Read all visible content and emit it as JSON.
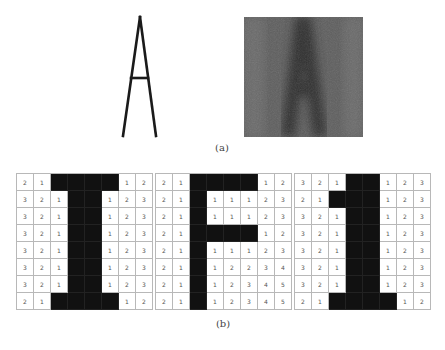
{
  "figure": {
    "panel_a": {
      "caption": "(a)",
      "glyph_letter": "A",
      "glyph_description": "thin-stroke letter A outline",
      "noisy_image_description": "noisy grayscale image of letter A",
      "gray_background": "#5c5c5c",
      "gray_letter": "#3a3a3a"
    },
    "panel_b": {
      "caption": "(b)",
      "grids": [
        {
          "letter": "I",
          "rows": [
            [
              "2",
              "1",
              "",
              "",
              "",
              "",
              "1",
              "2"
            ],
            [
              "3",
              "2",
              "1",
              "",
              "",
              "1",
              "2",
              "3"
            ],
            [
              "3",
              "2",
              "1",
              "",
              "",
              "1",
              "2",
              "3"
            ],
            [
              "3",
              "2",
              "1",
              "",
              "",
              "1",
              "2",
              "3"
            ],
            [
              "3",
              "2",
              "1",
              "",
              "",
              "1",
              "2",
              "3"
            ],
            [
              "3",
              "2",
              "1",
              "",
              "",
              "1",
              "2",
              "3"
            ],
            [
              "3",
              "2",
              "1",
              "",
              "",
              "1",
              "2",
              "3"
            ],
            [
              "2",
              "1",
              "",
              "",
              "",
              "",
              "1",
              "2"
            ]
          ]
        },
        {
          "letter": "F",
          "rows": [
            [
              "2",
              "1",
              "",
              "",
              "",
              "",
              "1",
              "2"
            ],
            [
              "2",
              "1",
              "",
              "1",
              "1",
              "1",
              "2",
              "3"
            ],
            [
              "2",
              "1",
              "",
              "1",
              "1",
              "1",
              "2",
              "3"
            ],
            [
              "2",
              "1",
              "",
              "",
              "",
              "",
              "1",
              "2"
            ],
            [
              "2",
              "1",
              "",
              "1",
              "1",
              "1",
              "2",
              "3"
            ],
            [
              "2",
              "1",
              "",
              "1",
              "2",
              "2",
              "3",
              "4"
            ],
            [
              "2",
              "1",
              "",
              "1",
              "2",
              "3",
              "4",
              "5"
            ],
            [
              "2",
              "1",
              "",
              "1",
              "2",
              "3",
              "4",
              "5"
            ]
          ]
        },
        {
          "letter": "1",
          "rows": [
            [
              "3",
              "2",
              "1",
              "",
              "",
              "1",
              "2",
              "3"
            ],
            [
              "2",
              "1",
              "",
              "",
              "",
              "1",
              "2",
              "3"
            ],
            [
              "3",
              "2",
              "1",
              "",
              "",
              "1",
              "2",
              "3"
            ],
            [
              "3",
              "2",
              "1",
              "",
              "",
              "1",
              "2",
              "3"
            ],
            [
              "3",
              "2",
              "1",
              "",
              "",
              "1",
              "2",
              "3"
            ],
            [
              "3",
              "2",
              "1",
              "",
              "",
              "1",
              "2",
              "3"
            ],
            [
              "3",
              "2",
              "1",
              "",
              "",
              "1",
              "2",
              "3"
            ],
            [
              "2",
              "1",
              "",
              "",
              "",
              "",
              "1",
              "2"
            ]
          ]
        }
      ],
      "black_cell_color": "#111111",
      "grid_line_color": "#b8b8b8"
    }
  }
}
